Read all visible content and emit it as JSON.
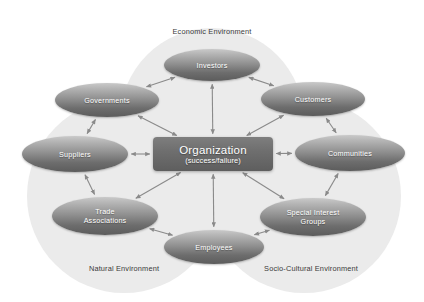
{
  "diagram": {
    "center": {
      "title": "Organization",
      "subtitle": "(success/failure)"
    },
    "environments": [
      {
        "id": "economic",
        "label": "Economic Environment",
        "cx": 212,
        "cy": 120,
        "r": 92,
        "label_x": 212,
        "label_y": 32
      },
      {
        "id": "natural",
        "label": "Natural Environment",
        "cx": 124,
        "cy": 196,
        "r": 97,
        "label_x": 124,
        "label_y": 269
      },
      {
        "id": "socio",
        "label": "Socio-Cultural Environment",
        "cx": 304,
        "cy": 196,
        "r": 97,
        "label_x": 311,
        "label_y": 269
      }
    ],
    "nodes": [
      {
        "id": "investors",
        "label": "Investors",
        "cx": 212,
        "cy": 65,
        "rx": 48,
        "ry": 16
      },
      {
        "id": "governments",
        "label": "Governments",
        "cx": 107,
        "cy": 100,
        "rx": 52,
        "ry": 17
      },
      {
        "id": "customers",
        "label": "Customers",
        "cx": 313,
        "cy": 99,
        "rx": 52,
        "ry": 17
      },
      {
        "id": "suppliers",
        "label": "Suppliers",
        "cx": 75,
        "cy": 154,
        "rx": 53,
        "ry": 18
      },
      {
        "id": "communities",
        "label": "Communities",
        "cx": 350,
        "cy": 153,
        "rx": 55,
        "ry": 18
      },
      {
        "id": "trade-associations",
        "label": "Trade\nAssociations",
        "cx": 105,
        "cy": 216,
        "rx": 53,
        "ry": 19
      },
      {
        "id": "special-interest",
        "label": "Special Interest\nGroups",
        "cx": 313,
        "cy": 217,
        "rx": 53,
        "ry": 19
      },
      {
        "id": "employees",
        "label": "Employees",
        "cx": 214,
        "cy": 247,
        "rx": 50,
        "ry": 17
      }
    ],
    "connections": [
      {
        "from": "investors",
        "to": "center",
        "style": "double-arrow"
      },
      {
        "from": "governments",
        "to": "center",
        "style": "double-arrow"
      },
      {
        "from": "customers",
        "to": "center",
        "style": "double-arrow"
      },
      {
        "from": "suppliers",
        "to": "center",
        "style": "double-arrow"
      },
      {
        "from": "communities",
        "to": "center",
        "style": "double-arrow"
      },
      {
        "from": "trade-associations",
        "to": "center",
        "style": "double-arrow"
      },
      {
        "from": "special-interest",
        "to": "center",
        "style": "double-arrow"
      },
      {
        "from": "employees",
        "to": "center",
        "style": "double-arrow"
      },
      {
        "from": "governments",
        "to": "investors",
        "style": "double-arrow"
      },
      {
        "from": "investors",
        "to": "customers",
        "style": "double-arrow"
      },
      {
        "from": "governments",
        "to": "suppliers",
        "style": "double-arrow"
      },
      {
        "from": "customers",
        "to": "communities",
        "style": "double-arrow"
      },
      {
        "from": "suppliers",
        "to": "trade-associations",
        "style": "double-arrow"
      },
      {
        "from": "communities",
        "to": "special-interest",
        "style": "double-arrow"
      },
      {
        "from": "trade-associations",
        "to": "employees",
        "style": "double-arrow"
      },
      {
        "from": "employees",
        "to": "special-interest",
        "style": "double-arrow"
      }
    ],
    "colors": {
      "background": "#ffffff",
      "environment_fill": "#ebebeb",
      "node_light": "#c9c9c9",
      "node_dark": "#5c5c5c",
      "center_fill": "#6c6c6c",
      "arrow": "#8a8a8a",
      "label_text": "#3a3a3a",
      "node_text": "#ffffff"
    }
  }
}
